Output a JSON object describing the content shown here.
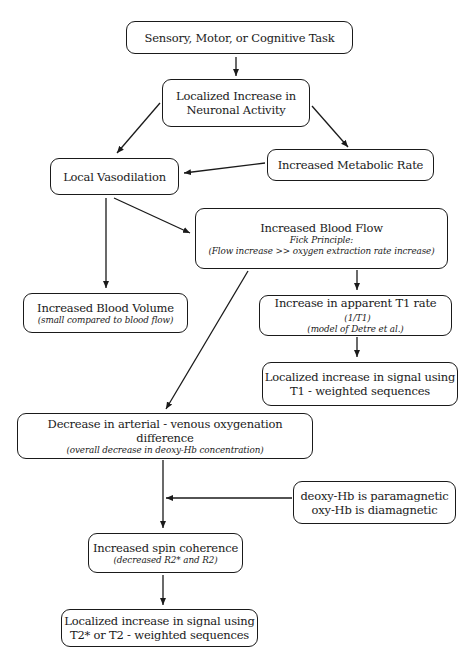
{
  "diagram": {
    "type": "flowchart",
    "nodes": {
      "task": {
        "main": "Sensory, Motor, or Cognitive Task"
      },
      "neuronal": {
        "line1": "Localized Increase in",
        "line2": "Neuronal Activity"
      },
      "metabolic": {
        "main": "Increased Metabolic Rate"
      },
      "vasodilation": {
        "main": "Local Vasodilation"
      },
      "bloodflow": {
        "main": "Increased Blood Flow",
        "sub1": "Fick Principle:",
        "sub2": "(Flow increase >> oxygen extraction rate increase)"
      },
      "bloodvolume": {
        "main": "Increased Blood Volume",
        "sub": "(small compared to blood flow)"
      },
      "t1rate": {
        "main": "Increase in apparent T1 rate",
        "main_note": "(1/T1)",
        "sub": "(model of Detre et al.)"
      },
      "t1signal": {
        "line1": "Localized increase in signal using",
        "line2": "T1 - weighted sequences"
      },
      "avdiff": {
        "main": "Decrease in arterial - venous oxygenation difference",
        "sub": "(overall decrease in deoxy-Hb concentration)"
      },
      "magnetic": {
        "line1": "deoxy-Hb is paramagnetic",
        "line2": "oxy-Hb is diamagnetic"
      },
      "spin": {
        "main": "Increased spin coherence",
        "sub": "(decreased R2* and R2)"
      },
      "t2signal": {
        "line1": "Localized increase in signal using",
        "line2": "T2* or T2 - weighted sequences"
      }
    },
    "edges": [
      [
        "task",
        "neuronal"
      ],
      [
        "neuronal",
        "vasodilation"
      ],
      [
        "neuronal",
        "metabolic"
      ],
      [
        "metabolic",
        "vasodilation"
      ],
      [
        "vasodilation",
        "bloodflow"
      ],
      [
        "vasodilation",
        "bloodvolume"
      ],
      [
        "bloodflow",
        "t1rate"
      ],
      [
        "t1rate",
        "t1signal"
      ],
      [
        "bloodflow",
        "avdiff"
      ],
      [
        "avdiff",
        "spin"
      ],
      [
        "magnetic",
        "avdiff-spin-line"
      ],
      [
        "spin",
        "t2signal"
      ]
    ]
  }
}
